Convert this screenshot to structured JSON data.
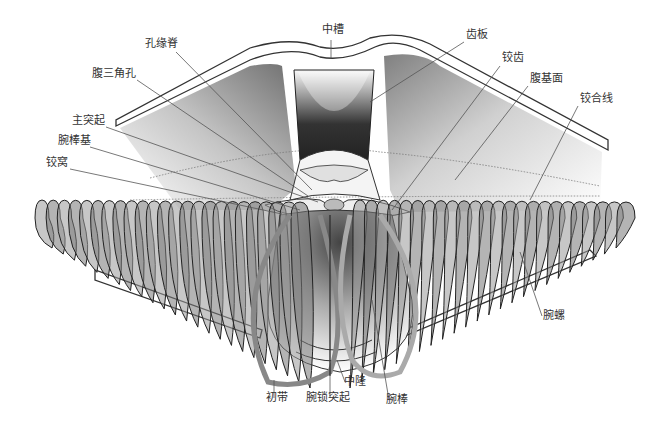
{
  "diagram": {
    "colors": {
      "background": "#ffffff",
      "outline": "#333333",
      "leader": "#555555",
      "fill_dark": "#3a3a3a",
      "fill_light": "#f2f2f2"
    },
    "labels": [
      {
        "id": "zhongcao",
        "text": "中槽",
        "x": 322,
        "y": 30
      },
      {
        "id": "kongyuanji",
        "text": "孔缘脊",
        "x": 145,
        "y": 44
      },
      {
        "id": "chiban",
        "text": "齿板",
        "x": 466,
        "y": 35
      },
      {
        "id": "jiaochi",
        "text": "铰齿",
        "x": 502,
        "y": 58
      },
      {
        "id": "fuji",
        "text": "腹三角孔",
        "x": 92,
        "y": 74
      },
      {
        "id": "fujimian",
        "text": "腹基面",
        "x": 530,
        "y": 79
      },
      {
        "id": "jiaohexian",
        "text": "铰合线",
        "x": 580,
        "y": 99
      },
      {
        "id": "zhutuqi",
        "text": "主突起",
        "x": 72,
        "y": 121
      },
      {
        "id": "wanbangji",
        "text": "腕棒基",
        "x": 58,
        "y": 141
      },
      {
        "id": "jiaowo",
        "text": "铰窝",
        "x": 46,
        "y": 163
      },
      {
        "id": "wanluo",
        "text": "腕螺",
        "x": 543,
        "y": 316
      },
      {
        "id": "zhonglong",
        "text": "中隆",
        "x": 344,
        "y": 382
      },
      {
        "id": "chudai",
        "text": "初带",
        "x": 266,
        "y": 398
      },
      {
        "id": "wansuotuqi",
        "text": "腕锁突起",
        "x": 306,
        "y": 398
      },
      {
        "id": "wanbang",
        "text": "腕棒",
        "x": 386,
        "y": 400
      }
    ]
  }
}
